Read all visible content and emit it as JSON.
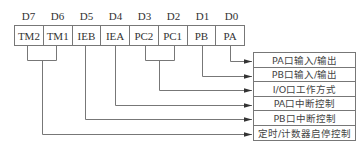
{
  "diagram": {
    "bits": [
      {
        "label": "D7",
        "field": "TM2"
      },
      {
        "label": "D6",
        "field": "TM1"
      },
      {
        "label": "D5",
        "field": "IEB"
      },
      {
        "label": "D4",
        "field": "IEA"
      },
      {
        "label": "D3",
        "field": "PC2"
      },
      {
        "label": "D2",
        "field": "PC1"
      },
      {
        "label": "D1",
        "field": "PB"
      },
      {
        "label": "D0",
        "field": "PA"
      }
    ],
    "descriptions": [
      "PA口输入/输出",
      "PB口输入/输出",
      "I/O口工作方式",
      "PA口中断控制",
      "PB口中断控制",
      "定时/计数器启停控制"
    ],
    "connections": [
      {
        "from": [
          "PA"
        ],
        "to": "PA口输入/输出"
      },
      {
        "from": [
          "PB"
        ],
        "to": "PB口输入/输出"
      },
      {
        "from": [
          "PC2",
          "PC1"
        ],
        "to": "I/O口工作方式"
      },
      {
        "from": [
          "IEA"
        ],
        "to": "PA口中断控制"
      },
      {
        "from": [
          "IEB"
        ],
        "to": "PB口中断控制"
      },
      {
        "from": [
          "TM2",
          "TM1"
        ],
        "to": "定时/计数器启停控制"
      }
    ],
    "line_color": "#777777"
  }
}
